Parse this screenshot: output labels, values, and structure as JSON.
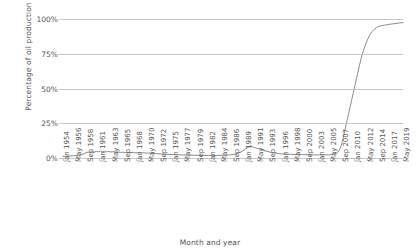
{
  "chart_data": {
    "type": "line",
    "title": "",
    "xlabel": "Month and year",
    "ylabel": "Percentage of oil production",
    "ylim": [
      0,
      100
    ],
    "ytick_labels": [
      "0%",
      "25%",
      "50%",
      "75%",
      "100%"
    ],
    "ytick_values": [
      0,
      25,
      50,
      75,
      100
    ],
    "grid": true,
    "legend": "none",
    "line_color": "#8c8c8c",
    "xtick_labels": [
      "Jan 1954",
      "May 1956",
      "Sep 1958",
      "Jan 1961",
      "May 1963",
      "Sep 1965",
      "Jan 1968",
      "May 1970",
      "Sep 1972",
      "Jan 1975",
      "May 1977",
      "Sep 1979",
      "Jan 1982",
      "May 1984",
      "Sep 1986",
      "Jan 1989",
      "May 1991",
      "Sep 1993",
      "Jan 1996",
      "May 1998",
      "Sep 2000",
      "Jan 2003",
      "May 2005",
      "Sep 2007",
      "Jan 2010",
      "May 2012",
      "Sep 2014",
      "Jan 2017",
      "May 2019"
    ],
    "series": [
      {
        "name": "Percentage of oil production",
        "x": [
          1954.0,
          1954.5,
          1955.0,
          1955.5,
          1956.0,
          1956.5,
          1957.0,
          1957.5,
          1958.0,
          1958.4,
          1958.8,
          1959.2,
          1959.6,
          1960.0,
          1960.4,
          1960.8,
          1961.2,
          1961.6,
          1962.0,
          1962.4,
          1962.8,
          1963.2,
          1963.6,
          1964.0,
          1964.5,
          1965.0,
          1965.5,
          1966.0,
          1966.5,
          1967.0,
          1967.5,
          1968.0,
          1968.5,
          1969.0,
          1969.5,
          1970.0,
          1970.5,
          1971.0,
          1971.5,
          1972.0,
          1973.0,
          1974.0,
          1975.0,
          1976.0,
          1977.0,
          1978.0,
          1979.0,
          1980.0,
          1981.0,
          1982.0,
          1983.0,
          1984.0,
          1985.0,
          1986.0,
          1986.8,
          1987.4,
          1988.0,
          1988.5,
          1989.0,
          1989.4,
          1989.8,
          1990.1,
          1990.4,
          1990.8,
          1991.2,
          1991.6,
          1992.0,
          1992.5,
          1993.0,
          1993.6,
          1994.2,
          1995.0,
          1996.0,
          1997.0,
          1998.0,
          1999.0,
          2000.0,
          2001.0,
          2002.0,
          2003.0,
          2004.0,
          2005.0,
          2005.8,
          2006.3,
          2006.8,
          2007.1,
          2007.4,
          2007.7,
          2008.0,
          2008.3,
          2008.6,
          2008.9,
          2009.2,
          2009.5,
          2009.8,
          2010.1,
          2010.4,
          2010.7,
          2011.0,
          2011.3,
          2011.6,
          2011.9,
          2012.2,
          2012.5,
          2012.9,
          2013.3,
          2013.8,
          2014.3,
          2015.0,
          2015.8,
          2016.5,
          2017.2,
          2018.0,
          2018.6,
          2019.0,
          2019.35
        ],
        "y": [
          1.2,
          1.3,
          1.4,
          1.5,
          1.6,
          1.8,
          2.0,
          2.4,
          3.0,
          3.8,
          4.3,
          4.0,
          4.6,
          4.2,
          4.8,
          4.4,
          5.0,
          4.5,
          4.9,
          4.4,
          4.7,
          4.3,
          4.6,
          4.2,
          4.4,
          4.0,
          4.2,
          3.9,
          4.1,
          3.8,
          4.0,
          3.7,
          3.9,
          3.6,
          3.8,
          3.5,
          3.6,
          3.3,
          3.4,
          3.1,
          2.9,
          2.7,
          2.5,
          2.3,
          2.2,
          2.1,
          2.0,
          1.9,
          1.9,
          1.8,
          1.8,
          1.9,
          2.0,
          2.2,
          2.6,
          3.2,
          4.0,
          5.0,
          6.2,
          7.2,
          8.0,
          8.5,
          8.1,
          7.6,
          7.0,
          6.6,
          6.2,
          5.6,
          5.0,
          4.4,
          3.9,
          3.4,
          3.0,
          2.8,
          2.6,
          2.5,
          2.4,
          2.3,
          2.3,
          2.2,
          2.2,
          2.3,
          2.5,
          3.0,
          4.0,
          5.5,
          8.0,
          12.0,
          17.0,
          22.0,
          27.0,
          32.0,
          37.0,
          42.0,
          47.0,
          52.0,
          57.0,
          62.0,
          67.0,
          71.5,
          75.5,
          79.0,
          82.0,
          85.0,
          88.0,
          90.5,
          92.5,
          94.0,
          95.0,
          95.6,
          96.0,
          96.4,
          96.8,
          97.1,
          97.3,
          97.4
        ]
      }
    ]
  }
}
